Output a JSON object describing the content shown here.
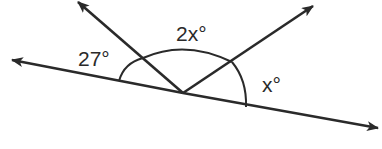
{
  "diagram": {
    "type": "angles-on-a-line",
    "vertex": [
      183,
      93
    ],
    "rays": [
      {
        "name": "left-line-ray",
        "tip": [
          12,
          60
        ]
      },
      {
        "name": "right-line-ray",
        "tip": [
          378,
          128
        ]
      },
      {
        "name": "upper-left-ray",
        "tip": [
          78,
          2
        ]
      },
      {
        "name": "upper-right-ray",
        "tip": [
          313,
          6
        ]
      }
    ],
    "angles": [
      {
        "label": "27°",
        "position": [
          78,
          66
        ]
      },
      {
        "label": "2x°",
        "position": [
          176,
          41
        ]
      },
      {
        "label": "x°",
        "position": [
          262,
          92
        ]
      }
    ],
    "stroke_color": "#2a2a2a"
  }
}
